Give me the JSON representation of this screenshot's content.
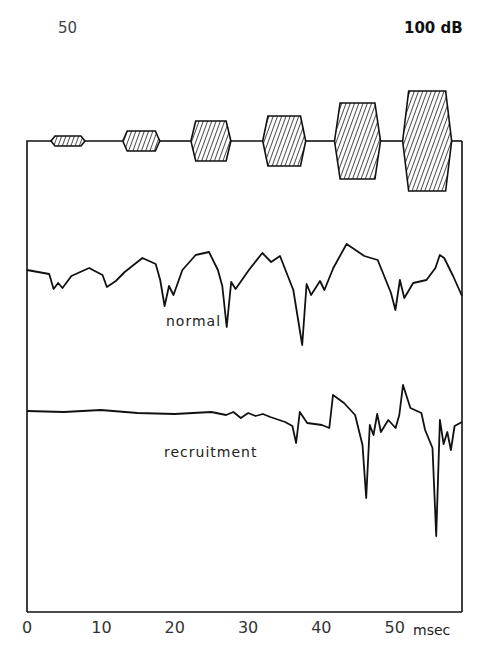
{
  "labels": {
    "start_level": "50",
    "end_level": "100 dB",
    "trace1": "normal",
    "trace2": "recruitment",
    "unit": "msec"
  },
  "colors": {
    "ink": "#111111",
    "background": "#ffffff"
  },
  "chart_data": {
    "type": "line",
    "title": "",
    "xlabel": "msec",
    "ylabel": "",
    "xlim": [
      0,
      54
    ],
    "x_ticks": [
      0,
      10,
      20,
      30,
      40,
      50
    ],
    "grid": false,
    "annotations": [
      "50",
      "100 dB"
    ],
    "stimulus": {
      "description": "Six tone bursts of increasing level from 50 dB to 100 dB (10 dB steps)",
      "levels_dB": [
        50,
        60,
        70,
        80,
        90,
        100
      ],
      "burst_centers_ms": [
        6,
        16,
        25.5,
        35.5,
        45.5,
        55
      ],
      "burst_half_heights_px": [
        5,
        10,
        20,
        25,
        38,
        50
      ]
    },
    "series": [
      {
        "name": "normal",
        "points": [
          [
            0,
            270
          ],
          [
            5,
            274
          ],
          [
            6,
            289
          ],
          [
            7,
            283
          ],
          [
            8,
            288
          ],
          [
            10,
            276
          ],
          [
            14,
            268
          ],
          [
            17,
            275
          ],
          [
            18,
            287
          ],
          [
            20,
            281
          ],
          [
            22,
            272
          ],
          [
            26,
            258
          ],
          [
            29,
            264
          ],
          [
            30,
            280
          ],
          [
            31,
            306
          ],
          [
            32,
            286
          ],
          [
            33,
            295
          ],
          [
            35,
            270
          ],
          [
            38,
            255
          ],
          [
            41,
            252
          ],
          [
            43,
            270
          ],
          [
            44,
            286
          ],
          [
            45,
            327
          ],
          [
            46,
            282
          ],
          [
            47,
            289
          ],
          [
            50,
            270
          ],
          [
            53,
            253
          ],
          [
            55,
            262
          ],
          [
            57,
            256
          ],
          [
            60,
            290
          ],
          [
            62,
            345
          ],
          [
            63,
            284
          ],
          [
            64,
            295
          ],
          [
            66,
            281
          ],
          [
            67,
            290
          ],
          [
            69,
            268
          ],
          [
            72,
            244
          ],
          [
            74,
            250
          ],
          [
            76,
            256
          ],
          [
            79,
            260
          ],
          [
            82,
            293
          ],
          [
            83,
            310
          ],
          [
            84,
            280
          ],
          [
            85,
            298
          ],
          [
            87,
            283
          ],
          [
            90,
            280
          ],
          [
            92,
            268
          ],
          [
            93,
            255
          ],
          [
            94,
            258
          ],
          [
            96,
            276
          ],
          [
            98,
            296
          ]
        ],
        "x_scale_note": "x values in 0.5 ms units; y in px"
      },
      {
        "name": "recruitment",
        "points": [
          [
            0,
            411
          ],
          [
            10,
            412
          ],
          [
            20,
            410
          ],
          [
            30,
            413
          ],
          [
            40,
            414
          ],
          [
            50,
            412
          ],
          [
            54,
            415
          ],
          [
            56,
            412
          ],
          [
            58,
            418
          ],
          [
            60,
            413
          ],
          [
            62,
            416
          ],
          [
            64,
            414
          ],
          [
            66,
            417
          ],
          [
            70,
            422
          ],
          [
            72,
            426
          ],
          [
            73,
            443
          ],
          [
            74,
            412
          ],
          [
            76,
            423
          ],
          [
            80,
            425
          ],
          [
            82,
            428
          ],
          [
            83,
            395
          ],
          [
            86,
            403
          ],
          [
            89,
            415
          ],
          [
            91,
            445
          ],
          [
            92,
            498
          ],
          [
            93,
            425
          ],
          [
            94,
            435
          ],
          [
            95,
            414
          ],
          [
            96,
            432
          ],
          [
            98,
            420
          ],
          [
            100,
            428
          ],
          [
            101,
            415
          ],
          [
            102,
            385
          ],
          [
            104,
            408
          ],
          [
            107,
            413
          ],
          [
            108,
            430
          ],
          [
            110,
            448
          ],
          [
            111,
            536
          ],
          [
            112,
            420
          ],
          [
            113,
            444
          ],
          [
            114,
            432
          ],
          [
            115,
            450
          ],
          [
            116,
            426
          ],
          [
            118,
            422
          ]
        ],
        "x_scale_note": "x values in 0.5 ms units; y in px"
      }
    ]
  }
}
